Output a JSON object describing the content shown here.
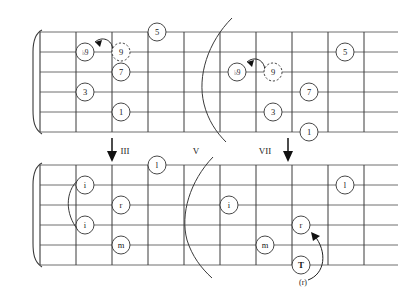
{
  "figure": {
    "type": "guitar-fretboard-diagram",
    "strings": 6,
    "frets": 10,
    "ink_color": "#3a3a3a",
    "background": "#ffffff"
  },
  "fret_markers": [
    {
      "label": "III",
      "fret": 3,
      "arrow": true
    },
    {
      "label": "V",
      "fret": 5,
      "arrow": false
    },
    {
      "label": "VII",
      "fret": 7,
      "arrow": true
    }
  ],
  "upper_board": {
    "name": "scale-degree-board",
    "left_shape": {
      "name": "shape-third-position",
      "dots": [
        {
          "label": "♭9",
          "string": 2,
          "fret": 1,
          "style": "solid"
        },
        {
          "label": "9",
          "string": 2,
          "fret": 2,
          "style": "dashed"
        },
        {
          "label": "5",
          "string": 1,
          "fret": 3,
          "style": "solid"
        },
        {
          "label": "7",
          "string": 3,
          "fret": 2,
          "style": "solid"
        },
        {
          "label": "3",
          "string": 4,
          "fret": 1,
          "style": "solid"
        },
        {
          "label": "1",
          "string": 5,
          "fret": 2,
          "style": "solid"
        }
      ],
      "slur": {
        "from": "9",
        "to": "♭9",
        "direction": "left"
      }
    },
    "right_shape": {
      "name": "shape-seventh-position",
      "dots": [
        {
          "label": "♭9",
          "string": 3,
          "fret": 5,
          "style": "solid"
        },
        {
          "label": "9",
          "string": 3,
          "fret": 6,
          "style": "dashed"
        },
        {
          "label": "5",
          "string": 2,
          "fret": 8,
          "style": "solid"
        },
        {
          "label": "7",
          "string": 4,
          "fret": 7,
          "style": "solid"
        },
        {
          "label": "3",
          "string": 5,
          "fret": 6,
          "style": "solid"
        },
        {
          "label": "1",
          "string": 6,
          "fret": 7,
          "style": "solid"
        }
      ],
      "slur": {
        "from": "9",
        "to": "♭9",
        "direction": "left"
      }
    }
  },
  "lower_board": {
    "name": "fingering-board",
    "left_shape": {
      "name": "fingering-third-position",
      "dots": [
        {
          "label": "l",
          "string": 1,
          "fret": 3,
          "style": "solid"
        },
        {
          "label": "i",
          "string": 2,
          "fret": 1,
          "style": "solid"
        },
        {
          "label": "r",
          "string": 3,
          "fret": 2,
          "style": "solid"
        },
        {
          "label": "i",
          "string": 4,
          "fret": 1,
          "style": "solid"
        },
        {
          "label": "m",
          "string": 5,
          "fret": 2,
          "style": "solid"
        }
      ],
      "barre": {
        "from_string": 2,
        "to_string": 4,
        "fret": 1
      }
    },
    "right_shape": {
      "name": "fingering-seventh-position",
      "dots": [
        {
          "label": "l",
          "string": 2,
          "fret": 8,
          "style": "solid"
        },
        {
          "label": "i",
          "string": 3,
          "fret": 5,
          "style": "solid"
        },
        {
          "label": "r",
          "string": 4,
          "fret": 7,
          "style": "solid"
        },
        {
          "label": "m",
          "string": 5,
          "fret": 6,
          "style": "solid"
        },
        {
          "label": "T",
          "string": 6,
          "fret": 7,
          "style": "solid",
          "bold": true
        }
      ],
      "thumb_note": "(r)",
      "arrow": {
        "from": "(r)",
        "to": "r",
        "direction": "up"
      }
    }
  }
}
